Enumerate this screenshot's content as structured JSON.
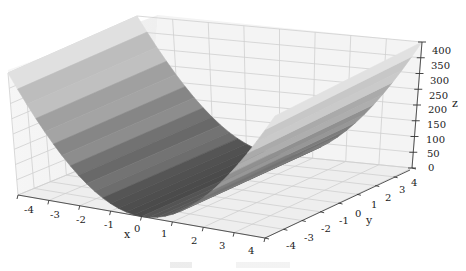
{
  "chart_data": {
    "type": "surface3d",
    "title": "",
    "function_hint": "z = 25 * x^2 (constant along y)",
    "xlabel": "x",
    "ylabel": "y",
    "zlabel": "z",
    "xlim": [
      -4,
      4
    ],
    "ylim": [
      -4,
      4
    ],
    "zlim": [
      0,
      400
    ],
    "x_ticks": [
      "-4",
      "-3",
      "-2",
      "-1",
      "0",
      "1",
      "2",
      "3",
      "4"
    ],
    "y_ticks": [
      "-4",
      "-3",
      "-2",
      "-1",
      "0",
      "1",
      "2",
      "3",
      "4"
    ],
    "z_ticks": [
      "0",
      "50",
      "100",
      "150",
      "200",
      "250",
      "300",
      "350",
      "400"
    ],
    "x": [
      -4,
      -3,
      -2,
      -1,
      0,
      1,
      2,
      3,
      4
    ],
    "z_at_x": [
      400,
      225,
      100,
      25,
      0,
      25,
      100,
      225,
      400
    ],
    "colormap": "grayscale",
    "grid": true,
    "legend": null
  },
  "colors": {
    "pane": "#f2f2f2",
    "grid": "#c8c8c8",
    "axis": "#333333",
    "surface_dark": "#4a4a4a",
    "surface_light": "#d9d9d9"
  }
}
